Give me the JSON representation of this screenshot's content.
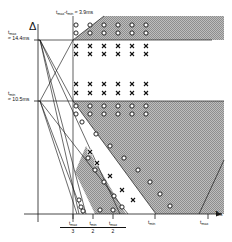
{
  "figure": {
    "type": "technical-timing-region-diagram",
    "background": "#ffffff",
    "ink": "#1a1a1a",
    "shade": "#9a9a9a",
    "axes": {
      "y_symbol": "Δ",
      "x_label_main": "T",
      "x_label_sub": "clk"
    },
    "y_ticks": [
      {
        "id": "tmax",
        "label": "t",
        "sub": "max",
        "value": "≈ 14.4ms",
        "y_px": 40
      },
      {
        "id": "tmin",
        "label": "t",
        "sub": "min",
        "value": "≈ 10.5ms",
        "y_px": 101
      }
    ],
    "top_annotation": {
      "text_a": "t",
      "sub_a": "max",
      "dash": "-",
      "text_b": "t",
      "sub_b": "min",
      "equals": "≈ 3.9ms"
    },
    "x_ticks": [
      {
        "num_label": "t",
        "num_sub": "max",
        "den": "3",
        "x_px": 73
      },
      {
        "num_label": "t",
        "num_sub": "min",
        "den": "2",
        "x_px": 93
      },
      {
        "num_label": "t",
        "num_sub": "max",
        "den": "2",
        "x_px": 113
      },
      {
        "num_label": "t",
        "num_sub": "min",
        "den": "",
        "x_px": 155
      },
      {
        "num_label": "t",
        "num_sub": "max",
        "den": "",
        "x_px": 208
      }
    ]
  },
  "chart_data": {
    "type": "scatter",
    "title": "",
    "xlabel": "T_clk",
    "ylabel": "Δ",
    "grid": false,
    "legend": "none",
    "axis_origin_px": {
      "x": 38,
      "y": 214
    },
    "xlim_px": [
      38,
      224
    ],
    "ylim_px": [
      214,
      16
    ],
    "constants": {
      "t_max_ms": 14.4,
      "t_min_ms": 10.5,
      "t_max_minus_t_min_ms": 3.9
    },
    "horizontal_lines": [
      {
        "name": "t_max_line",
        "y_px": 40,
        "x_from": 38,
        "x_to": 212
      },
      {
        "name": "t_min_line",
        "y_px": 101,
        "x_from": 38,
        "x_to": 224
      }
    ],
    "vertical_lines": [
      {
        "name": "t_max_over_3_line",
        "x_px": 73,
        "y_from": 16,
        "y_to": 222
      }
    ],
    "fan_lines_from_tmax": [
      {
        "to_x": 73,
        "to_y": 40
      },
      {
        "to_x": 73,
        "to_y": 101
      },
      {
        "to_x": 78,
        "to_y": 214
      },
      {
        "to_x": 85,
        "to_y": 214
      },
      {
        "to_x": 118,
        "to_y": 214
      }
    ],
    "fan_lines_from_tmin": [
      {
        "to_x": 73,
        "to_y": 40
      },
      {
        "to_x": 78,
        "to_y": 214
      },
      {
        "to_x": 83,
        "to_y": 214
      },
      {
        "to_x": 124,
        "to_y": 214
      }
    ],
    "shaded_regions": [
      {
        "name": "upper-band",
        "points": "104,16 224,16 224,40 73,40"
      },
      {
        "name": "main-wedge",
        "points": "73,101 224,101 224,214 156,214"
      },
      {
        "name": "right-wedge",
        "points": "200,195 224,160 224,214 200,214"
      },
      {
        "name": "lower-wedge",
        "points": "85,148 124,214 92,214 74,176"
      },
      {
        "name": "mid-wedge",
        "points": "91,160 132,214 98,214 80,183"
      }
    ],
    "series": [
      {
        "name": "circle-markers-above-tmax",
        "marker": "o",
        "points_px": [
          [
            76,
            25
          ],
          [
            90,
            25
          ],
          [
            104,
            25
          ],
          [
            118,
            25
          ],
          [
            132,
            25
          ],
          [
            146,
            25
          ],
          [
            76,
            33
          ],
          [
            90,
            33
          ],
          [
            104,
            33
          ],
          [
            118,
            33
          ],
          [
            132,
            33
          ],
          [
            146,
            33
          ]
        ]
      },
      {
        "name": "x-markers-below-tmax",
        "marker": "x",
        "points_px": [
          [
            76,
            46
          ],
          [
            90,
            46
          ],
          [
            104,
            46
          ],
          [
            118,
            46
          ],
          [
            132,
            46
          ],
          [
            146,
            46
          ],
          [
            76,
            54
          ],
          [
            90,
            54
          ],
          [
            104,
            54
          ],
          [
            118,
            54
          ],
          [
            132,
            54
          ],
          [
            146,
            54
          ]
        ]
      },
      {
        "name": "x-markers-above-tmin",
        "marker": "x",
        "points_px": [
          [
            76,
            84
          ],
          [
            90,
            84
          ],
          [
            104,
            84
          ],
          [
            118,
            84
          ],
          [
            132,
            84
          ],
          [
            146,
            84
          ],
          [
            76,
            93
          ],
          [
            90,
            93
          ],
          [
            104,
            93
          ],
          [
            118,
            93
          ],
          [
            132,
            93
          ],
          [
            146,
            93
          ]
        ]
      },
      {
        "name": "circle-markers-below-tmin",
        "marker": "o",
        "points_px": [
          [
            76,
            106
          ],
          [
            90,
            106
          ],
          [
            104,
            106
          ],
          [
            118,
            106
          ],
          [
            132,
            106
          ],
          [
            146,
            106
          ],
          [
            76,
            114
          ],
          [
            90,
            114
          ],
          [
            104,
            114
          ],
          [
            118,
            114
          ],
          [
            132,
            114
          ],
          [
            146,
            114
          ]
        ]
      },
      {
        "name": "diagonal-circles-main-boundary",
        "marker": "o",
        "points_px": [
          [
            82,
            122
          ],
          [
            96,
            134
          ],
          [
            110,
            146
          ],
          [
            124,
            158
          ],
          [
            138,
            170
          ],
          [
            150,
            182
          ],
          [
            160,
            194
          ],
          [
            170,
            206
          ]
        ]
      },
      {
        "name": "wedge-x-markers",
        "marker": "x",
        "points_px": [
          [
            90,
            152
          ],
          [
            97,
            163
          ],
          [
            110,
            176
          ],
          [
            122,
            190
          ],
          [
            133,
            200
          ]
        ]
      },
      {
        "name": "wedge-circle-markers",
        "marker": "o",
        "points_px": [
          [
            88,
            158
          ],
          [
            95,
            170
          ],
          [
            104,
            182
          ],
          [
            114,
            196
          ],
          [
            122,
            207
          ],
          [
            100,
            210
          ],
          [
            113,
            210
          ]
        ]
      },
      {
        "name": "left-cluster-markers",
        "marker": "o",
        "points_px": [
          [
            79,
            200
          ],
          [
            81,
            207
          ],
          [
            83,
            211
          ]
        ]
      }
    ]
  }
}
